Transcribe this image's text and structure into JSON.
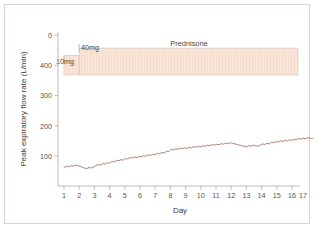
{
  "chart_data": {
    "type": "line",
    "title": "",
    "xlabel": "Day",
    "ylabel": "Peak expiratory flow rate (L/min)",
    "xlim": [
      0.5,
      17.6
    ],
    "ylim": [
      0,
      500
    ],
    "yticks": [
      500,
      400,
      300,
      200,
      100
    ],
    "ytick_labels": [
      "0",
      "400",
      "300",
      "200",
      "100"
    ],
    "xticks": [
      1,
      2,
      3,
      4,
      5,
      6,
      7,
      8,
      9,
      10,
      11,
      12,
      13,
      14,
      15,
      16,
      17
    ],
    "xtick_labels": [
      "1",
      "2",
      "3",
      "4",
      "5",
      "6",
      "7",
      "8",
      "9",
      "10",
      "11",
      "12",
      "13",
      "14",
      "15",
      "16",
      "17"
    ],
    "grid": false,
    "legend": "none",
    "series": [
      {
        "name": "Peak expiratory flow rate",
        "color": "#9d6f5e",
        "x": [
          1.0,
          1.15,
          1.3,
          1.45,
          1.6,
          1.75,
          1.9,
          2.05,
          2.2,
          2.35,
          2.5,
          2.65,
          2.8,
          2.95,
          3.1,
          3.25,
          3.4,
          3.55,
          3.7,
          3.85,
          4.0,
          4.15,
          4.3,
          4.45,
          4.6,
          4.75,
          4.9,
          5.05,
          5.2,
          5.35,
          5.5,
          5.65,
          5.8,
          5.95,
          6.1,
          6.25,
          6.4,
          6.55,
          6.7,
          6.85,
          7.0,
          7.15,
          7.3,
          7.45,
          7.6,
          7.75,
          7.9,
          8.05,
          8.2,
          8.35,
          8.5,
          8.65,
          8.8,
          8.95,
          9.1,
          9.25,
          9.4,
          9.55,
          9.7,
          9.85,
          10.0,
          10.15,
          10.3,
          10.45,
          10.6,
          10.75,
          10.9,
          11.05,
          11.2,
          11.35,
          11.5,
          11.65,
          11.8,
          11.95,
          12.1,
          12.25,
          12.4,
          12.55,
          12.7,
          12.85,
          13.0,
          13.15,
          13.3,
          13.45,
          13.6,
          13.75,
          13.9,
          14.05,
          14.2,
          14.35,
          14.5,
          14.65,
          14.8,
          14.95,
          15.1,
          15.25,
          15.4,
          15.55,
          15.7,
          15.85,
          16.0,
          16.15,
          16.3,
          16.45,
          16.6,
          16.75,
          16.9,
          17.05,
          17.2,
          17.35
        ],
        "y": [
          62,
          66,
          64,
          68,
          66,
          70,
          68,
          66,
          63,
          60,
          58,
          62,
          60,
          64,
          68,
          72,
          70,
          75,
          73,
          78,
          76,
          82,
          80,
          86,
          84,
          88,
          86,
          92,
          90,
          95,
          93,
          97,
          95,
          99,
          97,
          101,
          99,
          104,
          102,
          106,
          104,
          109,
          107,
          112,
          110,
          116,
          114,
          122,
          120,
          124,
          122,
          126,
          124,
          127,
          125,
          129,
          127,
          131,
          129,
          132,
          130,
          134,
          132,
          136,
          134,
          138,
          136,
          139,
          137,
          141,
          139,
          143,
          141,
          144,
          142,
          140,
          138,
          136,
          134,
          132,
          130,
          134,
          132,
          136,
          134,
          132,
          136,
          140,
          138,
          142,
          140,
          146,
          144,
          148,
          146,
          150,
          148,
          152,
          150,
          154,
          152,
          156,
          154,
          158,
          156,
          159,
          157,
          161,
          159,
          158
        ]
      }
    ],
    "annotations": [
      {
        "name": "treatment-band",
        "label": "Prednisone",
        "fill_color": "#fae6d9",
        "border_color": "#cfc6bf",
        "steps": [
          {
            "dose_label": "10mg",
            "x_start": 1.0,
            "x_end": 2.0,
            "y_top": 415,
            "y_bottom": 370
          },
          {
            "dose_label": "40mg",
            "x_start": 2.0,
            "x_end": 17.6,
            "y_top": 455,
            "y_bottom": 370
          }
        ]
      }
    ]
  }
}
